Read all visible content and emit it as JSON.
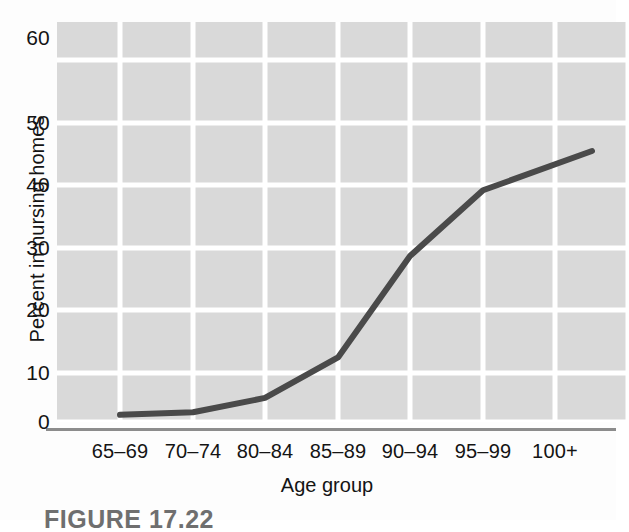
{
  "figure": {
    "caption": "FIGURE 17.22"
  },
  "axes": {
    "y_title": "Percent in nursing homes",
    "x_title": "Age group",
    "y_ticks": [
      "0",
      "10",
      "20",
      "30",
      "40",
      "50",
      "60"
    ],
    "x_ticks": [
      "65–69",
      "70–74",
      "80–84",
      "85–89",
      "90–94",
      "95–99",
      "100+"
    ]
  },
  "colors": {
    "panel_background": "#d9d9d9",
    "gridline": "#ffffff",
    "series_line": "#4a4a4a",
    "baseline": "#8c8c8c",
    "text": "#141414",
    "page_background": "#fdfdfd",
    "caption_text": "#6f6f6f"
  },
  "chart_data": {
    "type": "line",
    "title": "",
    "subtitle": "",
    "xlabel": "Age group",
    "ylabel": "Percent in nursing homes",
    "categories": [
      "65–69",
      "70–74",
      "80–84",
      "85–89",
      "90–94",
      "95–99",
      "100+"
    ],
    "values": [
      1.2,
      1.6,
      4.0,
      10.7,
      27.5,
      38.4,
      42.7
    ],
    "series": [
      {
        "name": "Percent in nursing homes",
        "values": [
          1.2,
          1.6,
          4.0,
          10.7,
          27.5,
          38.4,
          42.7
        ]
      }
    ],
    "ylim": [
      0,
      63
    ],
    "yticks": [
      0,
      10,
      20,
      30,
      40,
      50,
      60
    ],
    "xlim_categories": 7,
    "grid": true,
    "grid_axis": "both",
    "legend": false,
    "legend_position": "none",
    "line_color": "#4a4a4a",
    "line_width": 6,
    "markers": false,
    "annotations": []
  }
}
